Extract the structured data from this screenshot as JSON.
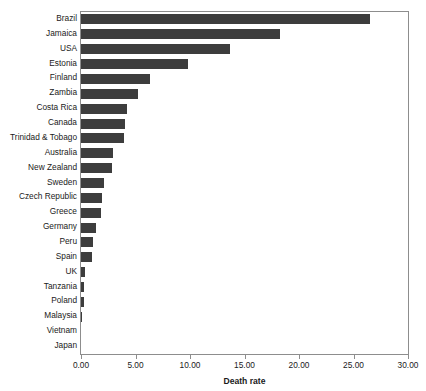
{
  "top_caption": "",
  "chart_data": {
    "type": "bar",
    "orientation": "horizontal",
    "title": "",
    "xlabel": "Death rate",
    "ylabel": "",
    "xlim": [
      0,
      30
    ],
    "xticks": [
      "0.00",
      "5.00",
      "10.00",
      "15.00",
      "20.00",
      "25.00",
      "30.00"
    ],
    "xtick_values": [
      0,
      5,
      10,
      15,
      20,
      25,
      30
    ],
    "grid": false,
    "legend": false,
    "bar_color": "#3d3d3d",
    "axis_color": "#8d8d8d",
    "categories": [
      "Brazil",
      "Jamaica",
      "USA",
      "Estonia",
      "Finland",
      "Zambia",
      "Costa Rica",
      "Canada",
      "Trinidad & Tobago",
      "Australia",
      "New Zealand",
      "Sweden",
      "Czech Republic",
      "Greece",
      "Germany",
      "Peru",
      "Spain",
      "UK",
      "Tanzania",
      "Poland",
      "Malaysia",
      "Vietnam",
      "Japan"
    ],
    "values": [
      26.5,
      18.3,
      13.7,
      9.8,
      6.3,
      5.2,
      4.2,
      4.0,
      3.9,
      2.9,
      2.8,
      2.1,
      1.9,
      1.8,
      1.4,
      1.1,
      1.0,
      0.35,
      0.3,
      0.25,
      0.05,
      0.0,
      0.0
    ]
  }
}
